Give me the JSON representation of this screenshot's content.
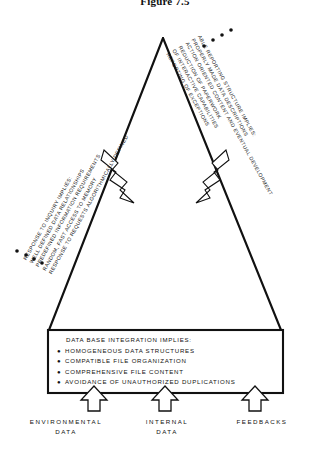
{
  "figure": {
    "title": "Figure 7.5",
    "ink_color": "#111111",
    "background": "#ffffff"
  },
  "left_callout": {
    "bullet_count": 4,
    "lines": [
      "RESPONSE TO INQUIRY IMPLIES:",
      "WELL DEFINED DATA RELATIONSHIPS",
      "PREDEFINED INFORMATION REQUIREMENTS",
      "RANDOM, FAST ACCESS TO MEMORY",
      "RESPONSE TO REQUESTS ALGORITHMICALLY DEFINED"
    ]
  },
  "right_callout": {
    "bullet_count": 4,
    "lines": [
      "ABLE REPORTING STRUCTURE IMPLIES:",
      "PROPERLY MADE DATA DESCRIPTIONS",
      "ACTION ORIENTED CONTENT AND EVENTUAL DEVELOPMENT",
      "REDUCTION OF PAPERWORK",
      "OF INTERACTIVE CAPABILITIES",
      "REPORTING OF EXCEPTIONS"
    ]
  },
  "base_box": {
    "heading": "DATA BASE INTEGRATION IMPLIES:",
    "bullet_glyph": "●",
    "items": [
      "HOMOGENEOUS DATA STRUCTURES",
      "COMPATIBLE FILE ORGANIZATION",
      "COMPREHENSIVE FILE CONTENT",
      "AVOIDANCE OF UNAUTHORIZED DUPLICATIONS"
    ]
  },
  "inputs": [
    {
      "name": "environmental",
      "line1": "ENVIRONMENTAL",
      "line2": "DATA"
    },
    {
      "name": "internal",
      "line1": "INTERNAL",
      "line2": "DATA"
    },
    {
      "name": "feedbacks",
      "line1": "FEEDBACKS",
      "line2": ""
    }
  ]
}
